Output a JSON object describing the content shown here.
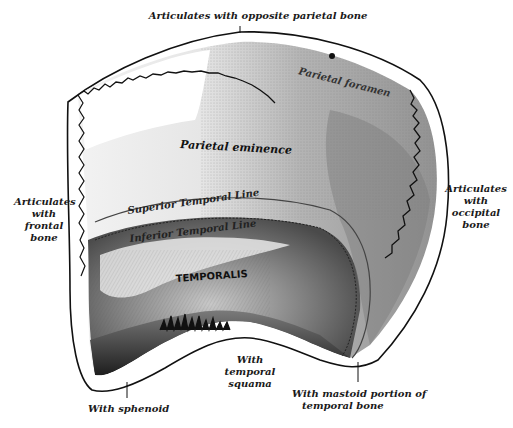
{
  "figure": {
    "colors": {
      "ink": "#111111",
      "background": "#ffffff",
      "shade_dark": "#2a2a2a",
      "shade_mid": "#8a8a8a",
      "shade_light": "#d0d0d0"
    }
  },
  "labels": {
    "top": "Articulates with opposite parietal bone",
    "left": [
      "Articulates",
      "with",
      "frontal",
      "bone"
    ],
    "right": [
      "Articulates",
      "with",
      "occipital",
      "bone"
    ],
    "bottom_left": "With sphenoid",
    "bottom_center": [
      "With",
      "temporal squama"
    ],
    "bottom_right": [
      "With mastoid portion of",
      "temporal bone"
    ]
  },
  "surface_labels": {
    "parietal_foramen": "Parietal foramen",
    "parietal_eminence": "Parietal eminence",
    "superior_temporal_line": "Superior Temporal Line",
    "inferior_temporal_line": "Inferior Temporal Line",
    "temporalis": "TEMPORALIS"
  }
}
